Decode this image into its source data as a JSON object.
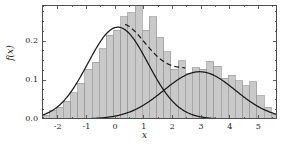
{
  "figure": {
    "background_color": "#ffffff",
    "axis_color": "#4d4d4d",
    "hist_fill": "#c9c9c9",
    "hist_edge": "#9a9a9a",
    "curve_color": "#1a1a1a",
    "x_axis_label": "x",
    "y_axis_label": "f(x)"
  },
  "chart_data": {
    "type": "bar",
    "title": "",
    "xlabel": "x",
    "ylabel": "f(x)",
    "xlim": [
      -2.55,
      5.65
    ],
    "ylim": [
      0.0,
      0.2925
    ],
    "grid": false,
    "legend": "none",
    "xticks": [
      -2,
      -1,
      0,
      1,
      2,
      3,
      4,
      5
    ],
    "xticklabels": [
      "-2",
      "-1",
      "0",
      "1",
      "2",
      "3",
      "4",
      "5"
    ],
    "yticks": [
      0.0,
      0.1,
      0.2
    ],
    "yticklabels": [
      "0.0",
      "0.1",
      "0.2"
    ],
    "xminor_step": 0.5,
    "yminor_step": 0.025,
    "histogram": {
      "bin_width": 0.25,
      "bin_left_edges": [
        -2.55,
        -2.3,
        -2.05,
        -1.8,
        -1.55,
        -1.3,
        -1.05,
        -0.8,
        -0.55,
        -0.3,
        -0.05,
        0.2,
        0.45,
        0.7,
        0.95,
        1.2,
        1.45,
        1.7,
        1.95,
        2.2,
        2.45,
        2.7,
        2.95,
        3.2,
        3.45,
        3.7,
        3.95,
        4.2,
        4.45,
        4.7,
        4.95,
        5.2,
        5.45
      ],
      "densities": [
        0.01,
        0.022,
        0.03,
        0.045,
        0.068,
        0.092,
        0.128,
        0.145,
        0.18,
        0.215,
        0.228,
        0.262,
        0.272,
        0.29,
        0.228,
        0.262,
        0.21,
        0.172,
        0.128,
        0.15,
        0.118,
        0.132,
        0.128,
        0.148,
        0.135,
        0.105,
        0.112,
        0.098,
        0.085,
        0.095,
        0.06,
        0.03,
        0.012
      ]
    },
    "series": [
      {
        "name": "component-1",
        "style": "solid",
        "type": "gaussian",
        "weight": 0.62,
        "mean": 0.1,
        "sigma": 1.05,
        "peak": 0.2885
      },
      {
        "name": "component-2",
        "style": "solid",
        "type": "gaussian",
        "weight": 0.38,
        "mean": 2.95,
        "sigma": 1.25,
        "peak": 0.1215
      },
      {
        "name": "mixture-tangent",
        "style": "dashed",
        "type": "dashed-overlay",
        "x_start": 0.35,
        "x_end": 2.45
      }
    ]
  }
}
